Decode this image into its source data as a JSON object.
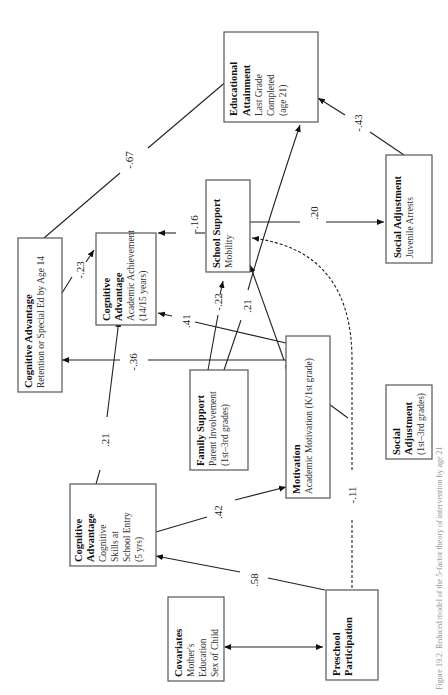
{
  "caption": "Figure 19.2. Reduced model of the 5-factor theory of intervention by age 21",
  "nodes": {
    "educational_attainment": {
      "title1": "Educational",
      "title2": "Attainment",
      "sub1": "Last Grade",
      "sub2": "Completed",
      "sub3": "(age 21)"
    },
    "social_adjustment_arrests": {
      "title": "Social Adjustment",
      "sub": "Juvenile Arrests"
    },
    "school_support": {
      "title": "School Support",
      "sub": "Mobility"
    },
    "cognitive_retention": {
      "title": "Cognitive Advantage",
      "sub": "Retention or Special Ed by Age 14"
    },
    "cognitive_achievement": {
      "title1": "Cognitive",
      "title2": "Advantage",
      "sub1": "Academic Achievement",
      "sub2": "(14/15 years)"
    },
    "family_support": {
      "title": "Family Support",
      "sub1": "Parent Involvement",
      "sub2": "(1st–3rd grades)"
    },
    "motivation": {
      "title": "Motivation",
      "sub": "Academic Motivation (K/1st grade)"
    },
    "social_adjustment_grades": {
      "title1": "Social",
      "title2": "Adjustment",
      "sub": "(1st–3rd grades)"
    },
    "cognitive_entry": {
      "title1": "Cognitive",
      "title2": "Advantage",
      "sub1": "Cognitive",
      "sub2": "Skills at",
      "sub3": "School Entry",
      "sub4": "(5 yrs)"
    },
    "covariates": {
      "title": "Covariates",
      "sub1": "Mother's",
      "sub2": "Education",
      "sub3": "Sex of Child"
    },
    "preschool": {
      "title1": "Preschool",
      "title2": "Participation"
    }
  },
  "coefficients": {
    "retention_to_attainment": "-.67",
    "arrests_to_attainment": "-.43",
    "retention_to_achievement": "-.23",
    "mobility_to_achievement": "-.16",
    "mobility_to_arrests": ".20",
    "family_to_mobility": "-.22",
    "family_to_attainment": ".21",
    "motivation_to_achievement": ".41",
    "motivation_to_retention": "-.36",
    "social_grades_to_mobility": "-.31",
    "entry_to_achievement": ".21",
    "entry_to_motivation": ".42",
    "preschool_to_mobility": "-.11",
    "preschool_to_entry": ".58"
  }
}
